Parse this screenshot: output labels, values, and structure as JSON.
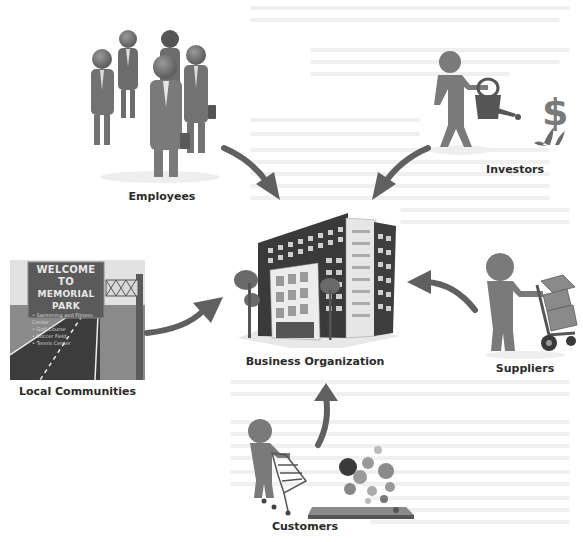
{
  "diagram": {
    "type": "stakeholder-hub",
    "center": {
      "id": "business",
      "label": "Business Organization"
    },
    "nodes": [
      {
        "id": "employees",
        "label": "Employees"
      },
      {
        "id": "investors",
        "label": "Investors"
      },
      {
        "id": "local",
        "label": "Local Communities"
      },
      {
        "id": "suppliers",
        "label": "Suppliers"
      },
      {
        "id": "customers",
        "label": "Customers"
      }
    ],
    "edges": [
      {
        "from": "employees",
        "to": "business"
      },
      {
        "from": "investors",
        "to": "business"
      },
      {
        "from": "local",
        "to": "business"
      },
      {
        "from": "suppliers",
        "to": "business"
      },
      {
        "from": "customers",
        "to": "business"
      }
    ],
    "sign": {
      "title_line1": "WELCOME TO",
      "title_line2": "MEMORIAL PARK",
      "items": [
        "Swimming and Fitness Center",
        "Golf Course",
        "Soccer Field",
        "Tennis Center"
      ]
    },
    "investor_symbol": "$"
  },
  "colors": {
    "figure": "#7a7a7a",
    "figure_dark": "#555555",
    "arrow": "#606060",
    "sign_bg": "#5a5a5a",
    "road": "#3c3c3c",
    "building_dark": "#3a3a3a",
    "building_light": "#e6e6e6"
  }
}
